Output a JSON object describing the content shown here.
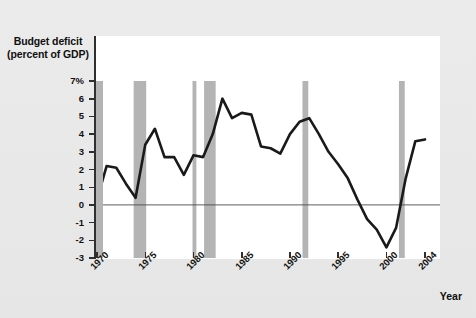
{
  "chart_data": {
    "type": "line",
    "title": "Budget deficit (percent of GDP)",
    "title_line1": "Budget deficit",
    "title_line2": "(percent of GDP)",
    "xlabel": "Year",
    "ylabel": "Budget deficit (percent of GDP)",
    "xlim": [
      1970,
      2004
    ],
    "ylim": [
      -3,
      7
    ],
    "grid": false,
    "legend": "none",
    "x_tick_labels": [
      "1970",
      "1975",
      "1980",
      "1985",
      "1990",
      "1995",
      "2000",
      "2004"
    ],
    "x_ticks": [
      1970,
      1975,
      1980,
      1985,
      1990,
      1995,
      2000,
      2004
    ],
    "y_tick_labels": [
      "7%",
      "6",
      "5",
      "4",
      "3",
      "2",
      "1",
      "0",
      "-1",
      "-2",
      "-3"
    ],
    "y_ticks": [
      7,
      6,
      5,
      4,
      3,
      2,
      1,
      0,
      -1,
      -2,
      -3
    ],
    "zero_line": 0,
    "series": [
      {
        "name": "Budget deficit (percent of GDP)",
        "color": "#1a1a1a",
        "x": [
          1970,
          1971,
          1972,
          1973,
          1974,
          1975,
          1976,
          1977,
          1978,
          1979,
          1980,
          1981,
          1982,
          1983,
          1984,
          1985,
          1986,
          1987,
          1988,
          1989,
          1990,
          1991,
          1992,
          1993,
          1994,
          1995,
          1996,
          1997,
          1998,
          1999,
          2000,
          2001,
          2002,
          2003,
          2004
        ],
        "values": [
          0.3,
          2.2,
          2.1,
          1.2,
          0.4,
          3.4,
          4.3,
          2.7,
          2.7,
          1.7,
          2.8,
          2.7,
          4.0,
          6.0,
          4.9,
          5.2,
          5.1,
          3.3,
          3.2,
          2.9,
          4.0,
          4.7,
          4.9,
          4.0,
          3.0,
          2.3,
          1.5,
          0.3,
          -0.8,
          -1.4,
          -2.4,
          -1.3,
          1.5,
          3.6,
          3.7
        ]
      }
    ],
    "recession_bands": [
      {
        "name": "recession-1973-1975",
        "start": 1973.8,
        "end": 1975.1
      },
      {
        "name": "recession-1980",
        "start": 1979.9,
        "end": 1980.3
      },
      {
        "name": "recession-1981-1982",
        "start": 1981.1,
        "end": 1982.3
      },
      {
        "name": "recession-1990-1991",
        "start": 1991.3,
        "end": 1991.9
      },
      {
        "name": "recession-2001",
        "start": 2001.3,
        "end": 2001.9
      }
    ],
    "colors": {
      "line": "#1a1a1a",
      "recession_band": "#b4b4b4",
      "axis": "#3a3a3a",
      "plot_background": "#ffffff",
      "page_background": "#e9e9e9",
      "text": "#13120f"
    }
  }
}
